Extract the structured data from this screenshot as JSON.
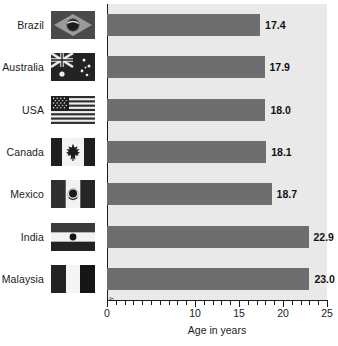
{
  "chart_data": {
    "type": "bar",
    "orientation": "horizontal",
    "title": "",
    "xlabel": "Age in years",
    "ylabel": "",
    "categories": [
      "Brazil",
      "Australia",
      "USA",
      "Canada",
      "Mexico",
      "India",
      "Malaysia"
    ],
    "values": [
      17.4,
      17.9,
      18.0,
      18.1,
      18.7,
      22.9,
      23.0
    ],
    "value_labels": [
      "17.4",
      "17.9",
      "18.0",
      "18.1",
      "18.7",
      "22.9",
      "23.0"
    ],
    "xlim": [
      0,
      25
    ],
    "xticks": [
      0,
      10,
      15,
      20,
      25
    ],
    "xtick_labels": [
      "0",
      "10",
      "15",
      "20",
      "25"
    ],
    "minor_tick_interval": 1,
    "axis_break_after": 0,
    "grid": false,
    "legend": null,
    "bar_color": "#6e6e6e",
    "plot_background": "#e9e9e9",
    "page_background": "#ffffff",
    "axis_color": "#1a1a1a",
    "label_color": "#111111"
  },
  "rows": [
    {
      "country": "Brazil",
      "value_label": "17.4",
      "flag_name": "flag-brazil-icon"
    },
    {
      "country": "Australia",
      "value_label": "17.9",
      "flag_name": "flag-australia-icon"
    },
    {
      "country": "USA",
      "value_label": "18.0",
      "flag_name": "flag-usa-icon"
    },
    {
      "country": "Canada",
      "value_label": "18.1",
      "flag_name": "flag-canada-icon"
    },
    {
      "country": "Mexico",
      "value_label": "18.7",
      "flag_name": "flag-mexico-icon"
    },
    {
      "country": "India",
      "value_label": "22.9",
      "flag_name": "flag-india-icon"
    },
    {
      "country": "Malaysia",
      "value_label": "23.0",
      "flag_name": "flag-malaysia-icon"
    }
  ],
  "axis": {
    "title": "Age in years",
    "ticks": [
      "0",
      "10",
      "15",
      "20",
      "25"
    ]
  }
}
